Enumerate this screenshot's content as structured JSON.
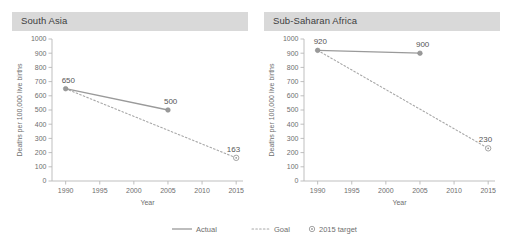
{
  "figure": {
    "background": "#ffffff",
    "header_fill": "#d9d9d9",
    "line_color": "#9a9a9a",
    "text_color": "#6e6e6e"
  },
  "panels": [
    {
      "title": "South Asia"
    },
    {
      "title": "Sub-Saharan Africa"
    }
  ],
  "legend": {
    "items": [
      {
        "label": "Actual",
        "marker": "solid-line"
      },
      {
        "label": "Goal",
        "marker": "dashed-line"
      },
      {
        "label": "2015 target",
        "marker": "open-circle"
      }
    ]
  },
  "chart_data": [
    {
      "type": "line",
      "title": "South Asia",
      "xlabel": "Year",
      "ylabel": "Deaths per 100,000 live births",
      "xlim": [
        1988,
        2016
      ],
      "ylim": [
        0,
        1000
      ],
      "xticks": [
        1990,
        1995,
        2000,
        2005,
        2010,
        2015
      ],
      "yticks": [
        0,
        100,
        200,
        300,
        400,
        500,
        600,
        700,
        800,
        900,
        1000
      ],
      "grid": false,
      "legend_position": "bottom-center-shared",
      "series": [
        {
          "name": "Actual",
          "style": "solid",
          "x": [
            1990,
            2005
          ],
          "values": [
            650,
            500
          ],
          "labels": [
            "650",
            "500"
          ]
        },
        {
          "name": "Goal",
          "style": "dashed",
          "x": [
            1990,
            2015
          ],
          "values": [
            650,
            163
          ],
          "labels": [
            "",
            ""
          ]
        },
        {
          "name": "2015 target",
          "style": "marker",
          "x": [
            2015
          ],
          "values": [
            163
          ],
          "labels": [
            "163"
          ]
        }
      ]
    },
    {
      "type": "line",
      "title": "Sub-Saharan Africa",
      "xlabel": "Year",
      "ylabel": "Deaths per 100,000 live births",
      "xlim": [
        1988,
        2016
      ],
      "ylim": [
        0,
        1000
      ],
      "xticks": [
        1990,
        1995,
        2000,
        2005,
        2010,
        2015
      ],
      "yticks": [
        0,
        100,
        200,
        300,
        400,
        500,
        600,
        700,
        800,
        900,
        1000
      ],
      "grid": false,
      "legend_position": "bottom-center-shared",
      "series": [
        {
          "name": "Actual",
          "style": "solid",
          "x": [
            1990,
            2005
          ],
          "values": [
            920,
            900
          ],
          "labels": [
            "920",
            "900"
          ]
        },
        {
          "name": "Goal",
          "style": "dashed",
          "x": [
            1990,
            2015
          ],
          "values": [
            920,
            230
          ],
          "labels": [
            "",
            ""
          ]
        },
        {
          "name": "2015 target",
          "style": "marker",
          "x": [
            2015
          ],
          "values": [
            230
          ],
          "labels": [
            "230"
          ]
        }
      ]
    }
  ]
}
